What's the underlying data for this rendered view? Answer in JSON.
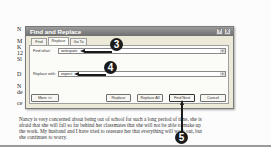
{
  "document": {
    "left_fragments": [
      "N",
      "M",
      "K",
      "12",
      "Sl",
      "D",
      "N",
      "de",
      "ce"
    ],
    "paragraph_lines": [
      "Nancy is very concerned about being out of school for such a long period of time, she is",
      "afraid that she will fall so far behind her classmates that she will not be able to make up",
      "the work. My husband and I have tried to reassure her that everything will work out, but",
      "she continues to worry."
    ]
  },
  "dialog": {
    "title": "Find and Replace",
    "help_button": "?",
    "close_button": "X",
    "tabs": [
      {
        "label": "Find",
        "active": false
      },
      {
        "label": "Replace",
        "active": true
      },
      {
        "label": "Go To",
        "active": false
      }
    ],
    "find_what": {
      "label": "Find what:",
      "value": "anticipate"
    },
    "replace_with": {
      "label": "Replace with:",
      "value": "expect"
    },
    "dropdown_arrow": "▼",
    "buttons": {
      "more": "More >>",
      "replace": "Replace",
      "replace_all": "Replace All",
      "find_next": "Find Next",
      "cancel": "Cancel"
    }
  },
  "callouts": {
    "find_what_step": "3",
    "replace_with_step": "4",
    "find_next_step": "5"
  }
}
